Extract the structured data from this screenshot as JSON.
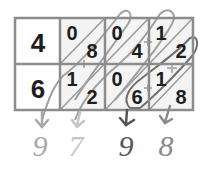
{
  "diagram": {
    "type": "lattice-multiplication",
    "row_labels": [
      "4",
      "6"
    ],
    "cells": [
      [
        {
          "tens": "0",
          "ones": "8"
        },
        {
          "tens": "0",
          "ones": "4"
        },
        {
          "tens": "1",
          "ones": "2"
        }
      ],
      [
        {
          "tens": "1",
          "ones": "2"
        },
        {
          "tens": "0",
          "ones": "6"
        },
        {
          "tens": "1",
          "ones": "8"
        }
      ]
    ],
    "result_digits": [
      {
        "value": "9",
        "color": "#a8a8a8"
      },
      {
        "value": "7",
        "color": "#c4c4c4"
      },
      {
        "value": "9",
        "color": "#555555"
      },
      {
        "value": "8",
        "color": "#8a8a8a"
      }
    ],
    "colors": {
      "grid": "#8c8c8c",
      "cell_bg": "#f4f4f4",
      "digit": "#1e1e1e",
      "loop": "#a0a0a0",
      "loop_dark": "#707070"
    }
  }
}
